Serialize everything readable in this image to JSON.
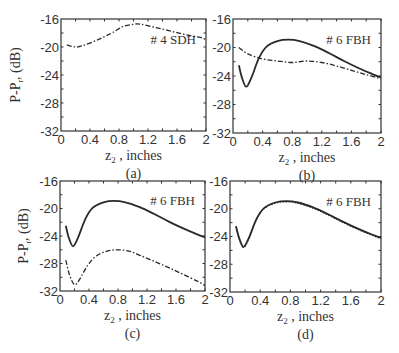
{
  "chart_data": [
    {
      "panel": "(a)",
      "type": "line",
      "annotation": "# 4 SDH",
      "xlabel": "z2 , inches",
      "ylabel": "P-P, (dB)",
      "xlim": [
        0,
        2
      ],
      "ylim": [
        -32,
        -16
      ],
      "xticks": [
        "0",
        "0.4",
        "0.8",
        "1.2",
        "1.6",
        "2"
      ],
      "yticks": [
        "-16",
        "-20",
        "-24",
        "-28",
        "-32"
      ],
      "series": [
        {
          "name": "dash-dot",
          "style": "dashdot",
          "x": [
            0.08,
            0.2,
            0.3,
            0.5,
            0.7,
            0.85,
            1.0,
            1.1,
            1.3,
            1.5,
            1.7,
            1.9,
            2.0
          ],
          "y": [
            -19.7,
            -20.0,
            -19.8,
            -19.0,
            -18.0,
            -17.1,
            -16.75,
            -16.75,
            -17.2,
            -17.7,
            -18.2,
            -18.6,
            -18.9
          ]
        }
      ]
    },
    {
      "panel": "(b)",
      "type": "line",
      "annotation": "# 6 FBH",
      "xlabel": "z2 , inches",
      "ylabel": "",
      "xlim": [
        0,
        2
      ],
      "ylim": [
        -32,
        -16
      ],
      "xticks": [
        "0",
        "0.4",
        "0.8",
        "1.2",
        "1.6",
        "2"
      ],
      "yticks": [
        "-16",
        "-20",
        "-24",
        "-28",
        "-32"
      ],
      "series": [
        {
          "name": "solid",
          "style": "solid",
          "x": [
            0.08,
            0.12,
            0.18,
            0.25,
            0.35,
            0.45,
            0.6,
            0.75,
            0.9,
            1.1,
            1.3,
            1.5,
            1.7,
            1.9,
            2.0
          ],
          "y": [
            -22.5,
            -24.2,
            -25.5,
            -24.2,
            -21.5,
            -19.9,
            -19.1,
            -18.9,
            -19.1,
            -19.8,
            -20.8,
            -21.9,
            -22.9,
            -23.8,
            -24.2
          ]
        },
        {
          "name": "dash-dot",
          "style": "dashdot",
          "x": [
            0.08,
            0.2,
            0.4,
            0.6,
            0.8,
            1.0,
            1.2,
            1.4,
            1.6,
            1.8,
            2.0
          ],
          "y": [
            -20.0,
            -20.9,
            -21.6,
            -21.9,
            -22.1,
            -21.9,
            -22.1,
            -22.6,
            -23.2,
            -23.8,
            -24.4
          ]
        }
      ]
    },
    {
      "panel": "(c)",
      "type": "line",
      "annotation": "# 6 FBH",
      "xlabel": "z2 , inches",
      "ylabel": "P-P, (dB)",
      "xlim": [
        0,
        2
      ],
      "ylim": [
        -32,
        -16
      ],
      "xticks": [
        "0",
        "0.4",
        "0.8",
        "1.2",
        "1.6",
        "2"
      ],
      "yticks": [
        "-16",
        "-20",
        "-24",
        "-28",
        "-32"
      ],
      "series": [
        {
          "name": "solid",
          "style": "solid",
          "x": [
            0.08,
            0.12,
            0.18,
            0.25,
            0.35,
            0.45,
            0.6,
            0.75,
            0.9,
            1.1,
            1.3,
            1.5,
            1.7,
            1.9,
            2.0
          ],
          "y": [
            -22.5,
            -24.2,
            -25.5,
            -24.2,
            -21.5,
            -19.9,
            -19.1,
            -18.9,
            -19.1,
            -19.8,
            -20.8,
            -21.9,
            -22.9,
            -23.8,
            -24.2
          ]
        },
        {
          "name": "dash-dot",
          "style": "dashdot",
          "x": [
            0.08,
            0.13,
            0.2,
            0.27,
            0.38,
            0.5,
            0.65,
            0.8,
            0.95,
            1.1,
            1.3,
            1.5,
            1.7,
            1.9,
            2.0
          ],
          "y": [
            -27.5,
            -29.6,
            -31.1,
            -30.3,
            -28.3,
            -26.9,
            -26.2,
            -26.0,
            -26.2,
            -26.8,
            -27.7,
            -28.6,
            -29.6,
            -30.6,
            -31.2
          ]
        }
      ]
    },
    {
      "panel": "(d)",
      "type": "line",
      "annotation": "# 6 FBH",
      "xlabel": "z2 , inches",
      "ylabel": "",
      "xlim": [
        0,
        2
      ],
      "ylim": [
        -32,
        -16
      ],
      "xticks": [
        "0",
        "0.4",
        "0.8",
        "1.2",
        "1.6",
        "2"
      ],
      "yticks": [
        "-16",
        "-20",
        "-24",
        "-28",
        "-32"
      ],
      "series": [
        {
          "name": "solid",
          "style": "solid",
          "x": [
            0.08,
            0.12,
            0.18,
            0.25,
            0.35,
            0.45,
            0.6,
            0.75,
            0.9,
            1.1,
            1.3,
            1.5,
            1.7,
            1.9,
            2.0
          ],
          "y": [
            -22.5,
            -24.2,
            -25.5,
            -24.2,
            -21.5,
            -19.9,
            -19.1,
            -18.9,
            -19.1,
            -19.8,
            -20.8,
            -21.9,
            -22.9,
            -23.8,
            -24.2
          ]
        },
        {
          "name": "dotted",
          "style": "dotted",
          "x": [
            0.08,
            0.12,
            0.18,
            0.25,
            0.35,
            0.45,
            0.6,
            0.75,
            0.9,
            1.1,
            1.3,
            1.5,
            1.7,
            1.9,
            2.0
          ],
          "y": [
            -22.6,
            -24.3,
            -25.6,
            -24.3,
            -21.6,
            -20.0,
            -19.2,
            -19.0,
            -19.2,
            -19.9,
            -20.9,
            -22.0,
            -23.0,
            -23.9,
            -24.3
          ]
        }
      ]
    }
  ],
  "layout": {
    "panels": [
      {
        "x0": 61,
        "x1": 206,
        "y0": 19,
        "y1": 131,
        "ylabel_x": 20,
        "ylabel_y": 75
      },
      {
        "x0": 233,
        "x1": 381,
        "y0": 19,
        "y1": 133,
        "ylabel_x": null,
        "ylabel_y": null
      },
      {
        "x0": 60,
        "x1": 205,
        "y0": 181,
        "y1": 291,
        "ylabel_x": 28,
        "ylabel_y": 236
      },
      {
        "x0": 230,
        "x1": 381,
        "y0": 181,
        "y1": 292,
        "ylabel_x": null,
        "ylabel_y": null
      }
    ],
    "line_color": "#2a2a2a",
    "axis_color": "#333333",
    "text_color": "#333333"
  }
}
